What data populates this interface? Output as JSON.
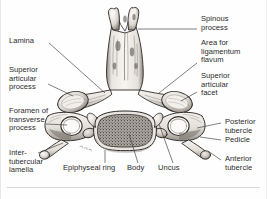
{
  "figure": {
    "view": "posterosuperior view",
    "ink_color": "#2b2b2b",
    "leader_color": "#3a3a3a",
    "background": "#fefefe"
  },
  "labels": {
    "lamina": "Lamina",
    "superior_articular_process": "Superior\narticular\nprocess",
    "foramen_of_transverse_process": "Foramen of\ntransverse\nprocess",
    "intertubercular_lamella": "Inter-\ntubercular\nlamella",
    "epiphyseal_ring": "Epiphyseal ring",
    "body": "Body",
    "uncus": "Uncus",
    "spinous_process": "Spinous\nprocess",
    "area_for_ligamentum_flavum": "Area for\nligamentum\nflavum",
    "superior_articular_facet": "Superior\narticular\nfacet",
    "posterior_tubercle": "Posterior\ntubercle",
    "pedicle": "Pedicle",
    "anterior_tubercle": "Anterior\ntubercle"
  }
}
